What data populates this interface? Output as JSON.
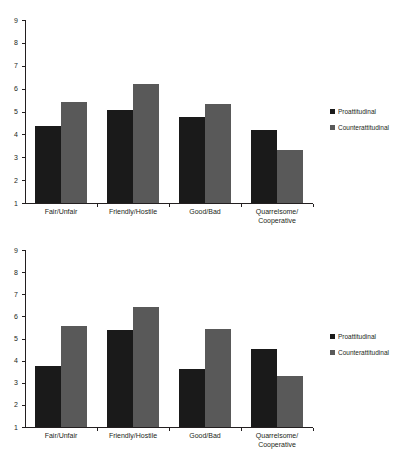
{
  "chart_data": [
    {
      "id": "top",
      "type": "bar",
      "title": "",
      "xlabel": "",
      "ylabel": "",
      "ylim": [
        1,
        9
      ],
      "yticks": [
        1,
        2,
        3,
        4,
        5,
        6,
        7,
        8,
        9
      ],
      "ytick_labels": [
        "1",
        "2",
        "3",
        "4",
        "5",
        "6",
        "7",
        "8",
        "9"
      ],
      "grid": false,
      "legend_position": "right",
      "categories": [
        "Fair/Unfair",
        "Friendly/Hostile",
        "Good/Bad",
        "Quarrelsome/\nCooperative"
      ],
      "series": [
        {
          "name": "Proattitudinal",
          "color": "#1a1a1a",
          "values": [
            4.35,
            5.05,
            4.75,
            4.17
          ]
        },
        {
          "name": "Counterattitudinal",
          "color": "#595959",
          "values": [
            5.4,
            6.2,
            5.33,
            3.3
          ]
        }
      ]
    },
    {
      "id": "bottom",
      "type": "bar",
      "title": "",
      "xlabel": "",
      "ylabel": "",
      "ylim": [
        1,
        9
      ],
      "yticks": [
        1,
        2,
        3,
        4,
        5,
        6,
        7,
        8,
        9
      ],
      "ytick_labels": [
        "1",
        "2",
        "3",
        "4",
        "5",
        "6",
        "7",
        "8",
        "9"
      ],
      "grid": false,
      "legend_position": "right",
      "categories": [
        "Fair/Unfair",
        "Friendly/Hostile",
        "Good/Bad",
        "Quarrelsome/\nCooperative"
      ],
      "series": [
        {
          "name": "Proattitudinal",
          "color": "#1a1a1a",
          "values": [
            3.75,
            5.4,
            3.6,
            4.52
          ]
        },
        {
          "name": "Counterattitudinal",
          "color": "#595959",
          "values": [
            5.57,
            6.42,
            5.45,
            3.32
          ]
        }
      ]
    }
  ]
}
